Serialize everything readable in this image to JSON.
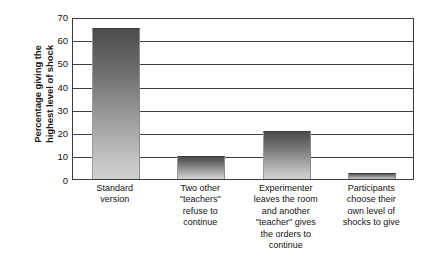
{
  "chart_data": {
    "type": "bar",
    "title": "",
    "subtitle": "",
    "xlabel": "",
    "ylabel": "Percentage giving the highest level of shock",
    "ylabel_lines": [
      "Percentage giving the",
      "highest level of shock"
    ],
    "ylim": [
      0,
      70
    ],
    "ytick_values": [
      70,
      60,
      50,
      40,
      30,
      20,
      10,
      0
    ],
    "ytick_labels": [
      "70",
      "60",
      "50",
      "40",
      "30",
      "20",
      "10",
      "0"
    ],
    "grid": "horizontal",
    "legend": "none",
    "categories": [
      "Standard version",
      "Two other \"teachers\" refuse to continue",
      "Experimenter leaves the room and another \"teacher\" gives the orders to continue",
      "Participants choose their own level of shocks to give"
    ],
    "category_lines": [
      [
        "Standard",
        "version"
      ],
      [
        "Two other",
        "\"teachers\"",
        "refuse to",
        "continue"
      ],
      [
        "Experimenter",
        "leaves the room",
        "and another",
        "\"teacher\" gives",
        "the orders to",
        "continue"
      ],
      [
        "Participants",
        "choose their",
        "own level of",
        "shocks to give"
      ]
    ],
    "values": [
      65,
      10,
      20.5,
      2.5
    ],
    "bar_fill_top_color": "#4c4c4c",
    "bar_fill_bottom_color": "#cfcfcf",
    "axis_color": "#3a3a3a",
    "background_color": "#ffffff"
  }
}
